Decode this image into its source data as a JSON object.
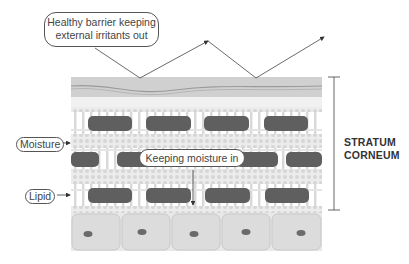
{
  "diagram": {
    "title_callout": {
      "line1": "Healthy barrier keeping",
      "line2": "external irritants out"
    },
    "center_callout": "Keeping moisture in",
    "labels": {
      "moisture": "Moisture",
      "lipid": "Lipid"
    },
    "bracket_label": {
      "line1": "STRATUM",
      "line2": "CORNEUM"
    },
    "colors": {
      "corneocyte": "#5f5f5f",
      "lipid_bg": "#e3e3e3",
      "top_layer": "#cfcfcf",
      "cell_fill": "#dcdcdc",
      "nucleus": "#6a6a6a",
      "line": "#444444"
    },
    "layers": [
      "surface film",
      "corneocyte row 1",
      "moisture band",
      "corneocyte row 2",
      "lipid band",
      "corneocyte row 3",
      "living cell layer"
    ],
    "living_cells": 5
  }
}
